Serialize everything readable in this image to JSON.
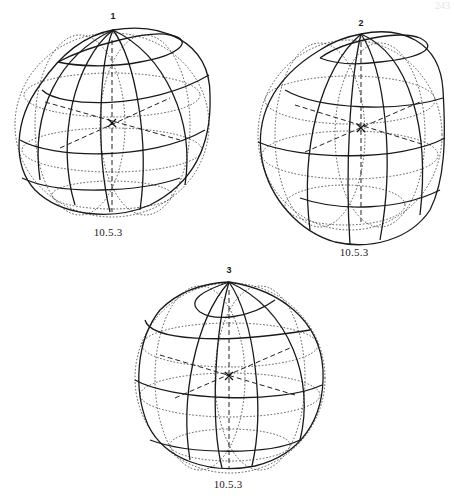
{
  "page": {
    "number": "243"
  },
  "figures": [
    {
      "id": "1",
      "label": "1",
      "caption": "10.5.3",
      "center": [
        112,
        123
      ]
    },
    {
      "id": "2",
      "label": "2",
      "caption": "10.5.3",
      "center": [
        361,
        128
      ]
    },
    {
      "id": "3",
      "label": "3",
      "caption": "10.5.3",
      "center": [
        229,
        376
      ]
    }
  ]
}
